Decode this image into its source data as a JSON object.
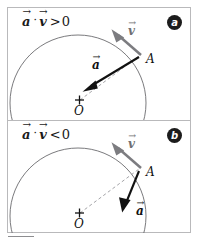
{
  "figure": {
    "colors": {
      "frame": "#b9b9bb",
      "circle": "#6b6b6e",
      "accel_vector": "#111111",
      "velocity_vector": "#7c7c80",
      "radius_dashed": "#9a9a9e",
      "badge_fill": "#1c1c1c",
      "badge_text": "#ffffff",
      "text": "#111111"
    },
    "footer_rule": "—"
  },
  "panels": [
    {
      "key": "a",
      "badge_label": "a",
      "condition": {
        "vector_a": "a",
        "dot_operator": "·",
        "vector_v": "v",
        "relation": ">",
        "value": "0",
        "plain_text": "a⃗ · v⃗ > 0"
      },
      "labels": {
        "point_on_circle": "A",
        "center": "O",
        "center_marker": "+",
        "velocity": "v",
        "acceleration": "a"
      },
      "meaning": "speed increasing: acceleration has a component along the velocity"
    },
    {
      "key": "b",
      "badge_label": "b",
      "condition": {
        "vector_a": "a",
        "dot_operator": "·",
        "vector_v": "v",
        "relation": "<",
        "value": "0",
        "plain_text": "a⃗ · v⃗ < 0"
      },
      "labels": {
        "point_on_circle": "A",
        "center": "O",
        "center_marker": "+",
        "velocity": "v",
        "acceleration": "a"
      },
      "meaning": "speed decreasing: acceleration has a component opposite the velocity"
    }
  ]
}
